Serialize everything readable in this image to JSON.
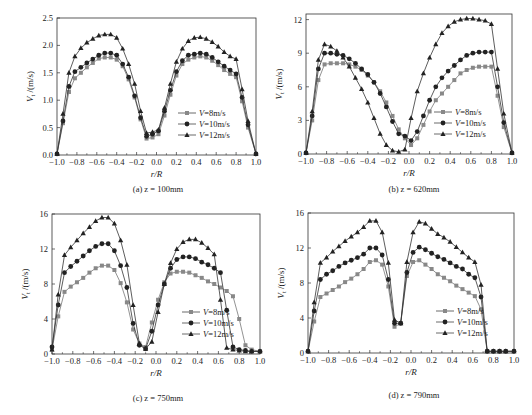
{
  "figure_caption": "",
  "chart_data": [
    {
      "id": "a",
      "type": "line",
      "title": "(a) z = 100mm",
      "xlabel": "r/R",
      "ylabel": "Vt/(m/s)",
      "xlim": [
        -1.0,
        1.0
      ],
      "ylim": [
        0.0,
        2.5
      ],
      "xticks": [
        "-1.0",
        "-0.8",
        "-0.6",
        "-0.4",
        "-0.2",
        "0.0",
        "0.2",
        "0.4",
        "0.6",
        "0.8",
        "1.0"
      ],
      "yticks": [
        "0.0",
        "0.5",
        "1.0",
        "1.5",
        "2.0",
        "2.5"
      ],
      "ytick_values": [
        0,
        0.5,
        1.0,
        1.5,
        2.0,
        2.5
      ],
      "grid": false,
      "legend_position": "lower-right",
      "x": [
        -1.0,
        -0.94,
        -0.88,
        -0.82,
        -0.76,
        -0.7,
        -0.64,
        -0.58,
        -0.52,
        -0.46,
        -0.4,
        -0.34,
        -0.28,
        -0.22,
        -0.16,
        -0.1,
        -0.04,
        0.02,
        0.08,
        0.14,
        0.2,
        0.26,
        0.32,
        0.38,
        0.44,
        0.5,
        0.56,
        0.62,
        0.68,
        0.74,
        0.8,
        0.86,
        0.92,
        1.0
      ],
      "series": [
        {
          "name": "V=8m/s",
          "marker": "square",
          "color": "#888888",
          "values": [
            0.02,
            0.58,
            1.15,
            1.4,
            1.5,
            1.6,
            1.68,
            1.76,
            1.78,
            1.78,
            1.74,
            1.62,
            1.38,
            1.05,
            0.65,
            0.3,
            0.32,
            0.38,
            0.72,
            1.1,
            1.45,
            1.66,
            1.74,
            1.78,
            1.8,
            1.78,
            1.72,
            1.64,
            1.55,
            1.48,
            1.42,
            0.98,
            0.5,
            0.02
          ]
        },
        {
          "name": "V=10m/s",
          "marker": "circle",
          "color": "#222222",
          "values": [
            0.02,
            0.62,
            1.25,
            1.52,
            1.6,
            1.68,
            1.75,
            1.82,
            1.86,
            1.86,
            1.82,
            1.66,
            1.42,
            1.08,
            0.68,
            0.34,
            0.38,
            0.44,
            0.8,
            1.18,
            1.52,
            1.72,
            1.82,
            1.84,
            1.86,
            1.84,
            1.78,
            1.7,
            1.62,
            1.55,
            1.48,
            1.05,
            0.55,
            0.02
          ]
        },
        {
          "name": "V=12m/s",
          "marker": "triangle",
          "color": "#222222",
          "values": [
            0.02,
            0.75,
            1.5,
            1.8,
            1.95,
            2.05,
            2.12,
            2.18,
            2.2,
            2.2,
            2.14,
            1.94,
            1.66,
            1.3,
            0.8,
            0.4,
            0.42,
            0.46,
            0.86,
            1.3,
            1.7,
            1.94,
            2.08,
            2.14,
            2.15,
            2.12,
            2.06,
            1.98,
            1.88,
            1.8,
            1.75,
            1.2,
            0.62,
            0.02
          ]
        }
      ]
    },
    {
      "id": "b",
      "type": "line",
      "title": "(b) z = 620mm",
      "xlabel": "r/R",
      "ylabel": "Vt/(m/s)",
      "xlim": [
        -1.0,
        1.0
      ],
      "ylim": [
        0,
        12.5
      ],
      "xticks": [
        "-1.0",
        "-0.8",
        "-0.6",
        "-0.4",
        "-0.2",
        "0.0",
        "0.2",
        "0.4",
        "0.6",
        "0.8",
        "1.0"
      ],
      "yticks": [
        "0",
        "3",
        "6",
        "9",
        "12"
      ],
      "ytick_values": [
        0,
        3,
        6,
        9,
        12
      ],
      "grid": false,
      "legend_position": "lower-right",
      "x": [
        -1.0,
        -0.94,
        -0.88,
        -0.82,
        -0.76,
        -0.7,
        -0.64,
        -0.58,
        -0.52,
        -0.46,
        -0.4,
        -0.34,
        -0.28,
        -0.22,
        -0.16,
        -0.1,
        -0.04,
        0.02,
        0.08,
        0.14,
        0.2,
        0.26,
        0.32,
        0.38,
        0.44,
        0.5,
        0.56,
        0.62,
        0.68,
        0.74,
        0.8,
        0.86,
        0.92,
        1.0
      ],
      "series": [
        {
          "name": "V=8m/s",
          "marker": "square",
          "color": "#888888",
          "values": [
            0.1,
            3.0,
            6.6,
            8.0,
            8.1,
            8.1,
            8.1,
            8.0,
            7.8,
            7.5,
            7.0,
            6.4,
            5.6,
            4.6,
            3.4,
            2.2,
            1.4,
            0.8,
            1.4,
            2.6,
            3.8,
            4.8,
            5.4,
            6.0,
            6.6,
            7.2,
            7.5,
            7.7,
            7.8,
            7.8,
            7.8,
            5.2,
            2.4,
            0.1
          ]
        },
        {
          "name": "V=10m/s",
          "marker": "circle",
          "color": "#222222",
          "values": [
            0.1,
            3.4,
            7.6,
            9.0,
            9.0,
            8.9,
            8.8,
            8.5,
            8.1,
            7.6,
            7.1,
            6.4,
            5.4,
            4.2,
            2.9,
            1.8,
            1.6,
            1.2,
            2.0,
            3.4,
            4.8,
            6.0,
            6.8,
            7.4,
            7.9,
            8.4,
            8.8,
            9.0,
            9.1,
            9.1,
            9.1,
            6.0,
            2.8,
            0.1
          ]
        },
        {
          "name": "V=12m/s",
          "marker": "triangle",
          "color": "#222222",
          "values": [
            0.1,
            3.8,
            8.4,
            9.8,
            9.6,
            9.2,
            8.6,
            7.8,
            6.8,
            5.8,
            4.6,
            3.2,
            1.8,
            0.8,
            0.3,
            0.2,
            0.4,
            3.2,
            5.6,
            7.2,
            8.6,
            9.8,
            10.8,
            11.4,
            11.8,
            12.0,
            12.1,
            12.1,
            12.0,
            11.9,
            11.6,
            7.6,
            3.6,
            0.1
          ]
        }
      ]
    },
    {
      "id": "c",
      "type": "line",
      "title": "(c) z = 750mm",
      "xlabel": "r/R",
      "ylabel": "Vt/(m/s)",
      "xlim": [
        -1.0,
        1.0
      ],
      "ylim": [
        0,
        16
      ],
      "xticks": [
        "-1.0",
        "-0.8",
        "-0.6",
        "-0.4",
        "-0.2",
        "0.0",
        "0.2",
        "0.4",
        "0.6",
        "0.8",
        "1.0"
      ],
      "yticks": [
        "0",
        "4",
        "8",
        "12",
        "16"
      ],
      "ytick_values": [
        0,
        4,
        8,
        12,
        16
      ],
      "grid": false,
      "legend_position": "lower-right",
      "x": [
        -1.0,
        -0.94,
        -0.88,
        -0.82,
        -0.76,
        -0.7,
        -0.64,
        -0.58,
        -0.52,
        -0.46,
        -0.4,
        -0.34,
        -0.28,
        -0.22,
        -0.16,
        -0.1,
        -0.04,
        0.02,
        0.08,
        0.14,
        0.2,
        0.26,
        0.32,
        0.38,
        0.44,
        0.5,
        0.56,
        0.62,
        0.68,
        0.74,
        0.8,
        0.86,
        0.92,
        1.0
      ],
      "series": [
        {
          "name": "V=8m/s",
          "marker": "square",
          "color": "#888888",
          "values": [
            0.5,
            4.3,
            7.1,
            7.7,
            8.2,
            8.7,
            9.3,
            9.8,
            10.1,
            10.1,
            9.6,
            8.1,
            5.9,
            2.8,
            1.2,
            0.8,
            3.6,
            6.2,
            8.2,
            9.2,
            9.4,
            9.4,
            9.3,
            9.0,
            8.7,
            8.3,
            8.0,
            7.6,
            7.2,
            6.6,
            4.0,
            1.0,
            0.5,
            0.3
          ]
        },
        {
          "name": "V=10m/s",
          "marker": "circle",
          "color": "#222222",
          "values": [
            0.8,
            5.6,
            9.3,
            10.0,
            10.6,
            11.2,
            11.8,
            12.3,
            12.6,
            12.6,
            11.8,
            10.1,
            7.6,
            3.5,
            1.0,
            0.6,
            2.6,
            5.6,
            8.0,
            9.8,
            10.8,
            11.1,
            11.1,
            10.9,
            10.5,
            10.2,
            9.8,
            9.3,
            5.0,
            0.8,
            0.5,
            0.4,
            0.3,
            0.3
          ]
        },
        {
          "name": "V=12m/s",
          "marker": "triangle",
          "color": "#222222",
          "values": [
            0.5,
            6.8,
            11.3,
            12.2,
            13.0,
            13.8,
            14.5,
            15.2,
            15.6,
            15.6,
            14.9,
            13.0,
            10.2,
            5.6,
            1.2,
            0.6,
            1.4,
            4.8,
            8.0,
            10.4,
            12.0,
            12.8,
            13.1,
            13.1,
            12.7,
            12.1,
            11.4,
            6.2,
            0.7,
            0.5,
            0.4,
            0.3,
            0.3,
            0.3
          ]
        }
      ]
    },
    {
      "id": "d",
      "type": "line",
      "title": "(d) z = 790mm",
      "xlabel": "r/R",
      "ylabel": "Vt/(m/s)",
      "xlim": [
        -1.0,
        1.0
      ],
      "ylim": [
        0,
        16
      ],
      "xticks": [
        "-1.0",
        "-0.8",
        "-0.6",
        "-0.4",
        "-0.2",
        "0.0",
        "0.2",
        "0.4",
        "0.6",
        "0.8",
        "1.0"
      ],
      "yticks": [
        "0",
        "4",
        "8",
        "12",
        "16"
      ],
      "ytick_values": [
        0,
        4,
        8,
        12,
        16
      ],
      "grid": false,
      "legend_position": "lower-right",
      "x": [
        -1.0,
        -0.94,
        -0.88,
        -0.82,
        -0.76,
        -0.7,
        -0.64,
        -0.58,
        -0.52,
        -0.46,
        -0.4,
        -0.34,
        -0.28,
        -0.22,
        -0.16,
        -0.1,
        -0.04,
        0.02,
        0.08,
        0.14,
        0.2,
        0.26,
        0.32,
        0.38,
        0.44,
        0.5,
        0.56,
        0.62,
        0.68,
        0.74,
        0.8,
        0.86,
        0.92,
        1.0
      ],
      "series": [
        {
          "name": "V=8m/s",
          "marker": "square",
          "color": "#888888",
          "values": [
            0.2,
            3.6,
            6.4,
            6.8,
            7.2,
            7.6,
            8.1,
            8.5,
            9.0,
            9.6,
            10.4,
            10.6,
            10.1,
            7.6,
            3.0,
            3.4,
            8.8,
            10.4,
            10.6,
            10.1,
            9.6,
            9.0,
            8.6,
            8.2,
            7.7,
            7.3,
            6.9,
            6.5,
            5.0,
            0.2,
            0.2,
            0.2,
            0.2,
            0.2
          ]
        },
        {
          "name": "V=10m/s",
          "marker": "circle",
          "color": "#222222",
          "values": [
            0.2,
            4.8,
            8.4,
            9.0,
            9.4,
            9.9,
            10.3,
            10.6,
            10.9,
            11.3,
            12.0,
            12.0,
            11.2,
            8.4,
            3.4,
            3.4,
            9.2,
            11.5,
            12.1,
            11.8,
            11.4,
            11.0,
            10.7,
            10.3,
            9.9,
            9.6,
            9.0,
            8.6,
            6.4,
            0.2,
            0.2,
            0.2,
            0.2,
            0.2
          ]
        },
        {
          "name": "V=12m/s",
          "marker": "triangle",
          "color": "#222222",
          "values": [
            0.2,
            5.8,
            10.3,
            10.9,
            11.6,
            12.2,
            12.8,
            13.3,
            13.8,
            14.4,
            15.1,
            15.1,
            13.8,
            10.3,
            3.8,
            3.4,
            10.4,
            13.8,
            15.0,
            14.8,
            14.2,
            13.6,
            13.2,
            12.7,
            12.1,
            11.5,
            10.9,
            10.4,
            7.8,
            0.2,
            0.2,
            0.2,
            0.2,
            0.2
          ]
        }
      ]
    }
  ]
}
